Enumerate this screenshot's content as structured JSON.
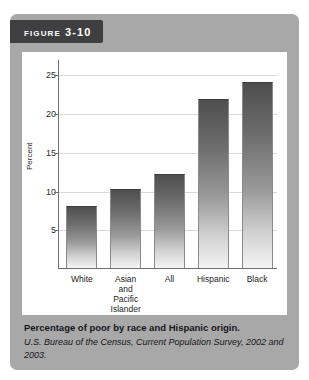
{
  "figure": {
    "tag_label": "Figure 3-10"
  },
  "caption": {
    "title": "Percentage of poor by race and Hispanic origin.",
    "source": "U.S. Bureau of the Census, Current Population Survey, 2002 and 2003."
  },
  "colors": {
    "card_background": "#a8a8a8",
    "tag_background": "#3f3f41",
    "panel_background": "#ffffff",
    "bar_top": "#4e4e4e",
    "bar_bottom": "#f4f4f4",
    "axis": "#6e6e6e",
    "gridline": "#d9d9d9"
  },
  "chart_data": {
    "type": "bar",
    "title": "Percentage of poor by race and Hispanic origin.",
    "xlabel": "",
    "ylabel": "Percent",
    "categories": [
      "White",
      "Asian and Pacific Islander",
      "All",
      "Hispanic",
      "Black"
    ],
    "category_lines": [
      [
        "White"
      ],
      [
        "Asian",
        "and",
        "Pacific",
        "Islander"
      ],
      [
        "All"
      ],
      [
        "Hispanic"
      ],
      [
        "Black"
      ]
    ],
    "values": [
      8.0,
      10.2,
      12.1,
      21.8,
      24.0
    ],
    "ylim": [
      0,
      27
    ],
    "yticks": [
      5,
      10,
      15,
      20,
      25
    ],
    "ytick_labels": [
      "5",
      "10",
      "15",
      "20",
      "25"
    ],
    "grid": true,
    "legend": false
  }
}
